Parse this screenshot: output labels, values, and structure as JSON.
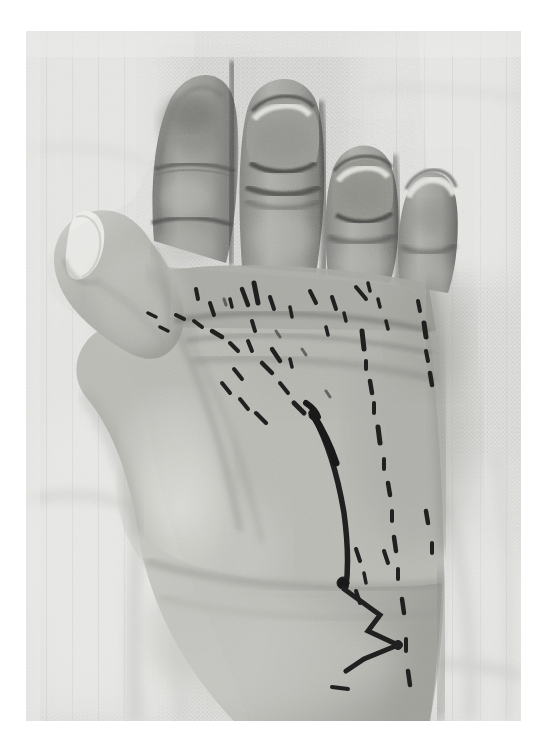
{
  "document": {
    "kind": "clinical-photograph",
    "page_background": "#ffffff",
    "caption": ""
  },
  "photo": {
    "label": "Palmar view of left hand with surgical skin markings",
    "frame": {
      "x": 26,
      "y": 31,
      "width": 495,
      "height": 690
    },
    "colorspace": "grayscale",
    "palette": {
      "page_white": "#ffffff",
      "gauze_light": "#e8e8e6",
      "gauze_mid": "#d5d5d3",
      "gauze_shadow": "#c2c2c0",
      "skin_highlight": "#dcdcd8",
      "skin_mid": "#b9b9b4",
      "skin_shadow": "#8e8e8a",
      "skin_dark": "#6d6d6a",
      "crease_dark": "#4a4a48",
      "nail_white": "#f2f2ef",
      "ink_mark": "#1b1b1b"
    },
    "content": {
      "background_material": "woven cotton gauze drape",
      "subject": "left hand, palm facing camera, fingers at top, wrist at bottom",
      "visible_digits": [
        "index finger",
        "middle finger",
        "ring finger",
        "little finger",
        "thumb"
      ],
      "nails_visible": [
        "thumb",
        "middle finger",
        "ring finger",
        "little finger"
      ],
      "markings": [
        {
          "name": "distal-palm-dashes",
          "type": "dashed line",
          "region": "distal palm below finger bases"
        },
        {
          "name": "thenar-oblique-dashes",
          "type": "dashed line",
          "region": "oblique across mid-palm toward thumb web"
        },
        {
          "name": "mid-palm-incision-line",
          "type": "solid line",
          "region": "curves from mid-palm down to wrist"
        },
        {
          "name": "wrist-zigzag",
          "type": "zig-zag (chevron) line",
          "region": "volar wrist crease"
        },
        {
          "name": "ulnar-dash-column",
          "type": "dashed line",
          "region": "column of dashes lateral to incision line"
        },
        {
          "name": "hypothenar-dashes",
          "type": "dashed line",
          "region": "ulnar border of palm"
        }
      ]
    }
  }
}
